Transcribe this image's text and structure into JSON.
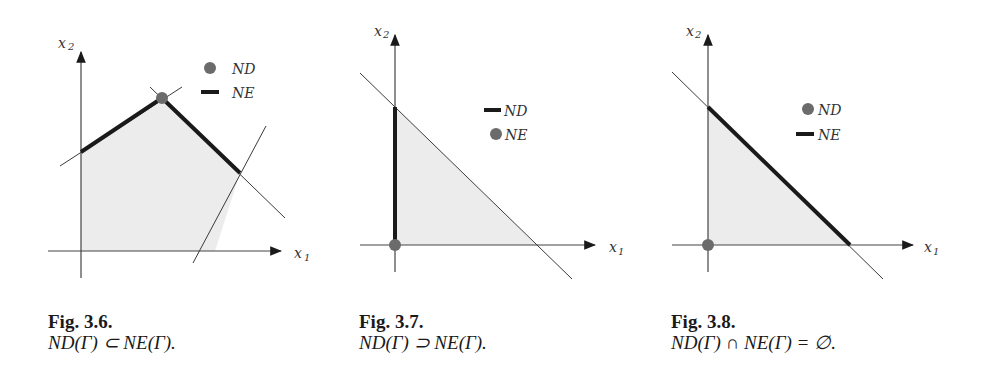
{
  "figures": [
    {
      "id": "fig-3-6",
      "caption_title": "Fig. 3.6.",
      "caption_formula": "ND(Γ) ⊂ NE(Γ).",
      "x_axis_label": "x",
      "x_axis_sub": "1",
      "y_axis_label": "x",
      "y_axis_sub": "2",
      "legend": [
        {
          "marker": "dot",
          "label": "ND"
        },
        {
          "marker": "thick-line",
          "label": "NE"
        }
      ]
    },
    {
      "id": "fig-3-7",
      "caption_title": "Fig. 3.7.",
      "caption_formula": "ND(Γ) ⊃ NE(Γ).",
      "x_axis_label": "x",
      "x_axis_sub": "1",
      "y_axis_label": "x",
      "y_axis_sub": "2",
      "legend": [
        {
          "marker": "thick-line",
          "label": "ND"
        },
        {
          "marker": "dot",
          "label": "NE"
        }
      ]
    },
    {
      "id": "fig-3-8",
      "caption_title": "Fig. 3.8.",
      "caption_formula": "ND(Γ) ∩ NE(Γ) = ∅.",
      "x_axis_label": "x",
      "x_axis_sub": "1",
      "y_axis_label": "x",
      "y_axis_sub": "2",
      "legend": [
        {
          "marker": "dot",
          "label": "ND"
        },
        {
          "marker": "thick-line",
          "label": "NE"
        }
      ]
    }
  ],
  "colors": {
    "region_fill": "#ececec",
    "line": "#3a3a3a",
    "thick_line": "#1a1a1a",
    "dot": "#6b6b6b"
  }
}
